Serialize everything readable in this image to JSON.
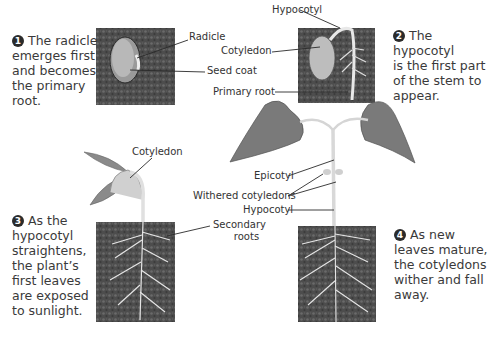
{
  "stages": [
    {
      "number": "1",
      "caption_lines": [
        "The radicle",
        "emerges first",
        "and becomes",
        "the primary",
        "root."
      ]
    },
    {
      "number": "2",
      "caption_lines": [
        "The hypocotyl",
        "is the first part",
        "of the stem to",
        "appear."
      ]
    },
    {
      "number": "3",
      "caption_lines": [
        "As the",
        "hypocotyl",
        "straightens,",
        "the plant’s",
        "first leaves",
        "are exposed",
        "to sunlight."
      ]
    },
    {
      "number": "4",
      "caption_lines": [
        "As new",
        "leaves mature,",
        "the cotyledons",
        "wither and fall",
        "away."
      ]
    }
  ],
  "labels": {
    "radicle": "Radicle",
    "seed_coat": "Seed coat",
    "cotyledon_1": "Cotyledon",
    "hypocotyl_1": "Hypocotyl",
    "primary_root": "Primary root",
    "cotyledon_2": "Cotyledon",
    "secondary_roots_1": "Secondary",
    "secondary_roots_2": "roots",
    "epicotyl": "Epicotyl",
    "withered_cotyledons": "Withered cotyledons",
    "hypocotyl_2": "Hypocotyl"
  },
  "colors": {
    "soil": "#4a4a4a",
    "leaf": "#7a7a7a",
    "stem": "#d8d8d8",
    "text": "#3a3a3a"
  }
}
